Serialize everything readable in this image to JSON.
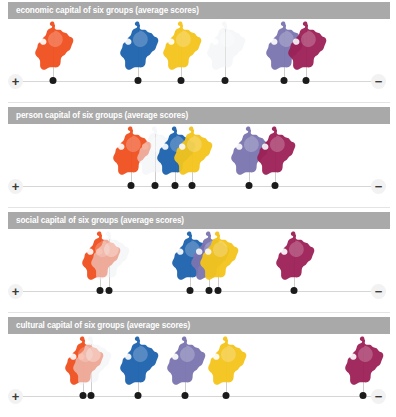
{
  "figure": {
    "background": "#ffffff",
    "title_bar_color": "#a9a9a9",
    "title_text_color": "#ffffff",
    "axis_color": "#d8d6d4",
    "dot_color": "#1b1b1b",
    "axis_left_label": "+",
    "axis_right_label": "−"
  },
  "group_colors": {
    "orange": "#f04f1e",
    "white": "#eef1f5",
    "blue": "#1d63ae",
    "yellow": "#f4c51c",
    "purple": "#7b74b0",
    "magenta": "#9c1f56"
  },
  "chart_data": {
    "type": "scatter",
    "title": "Capital of six groups (average scores)",
    "xlabel": "",
    "ylabel": "",
    "xlim": [
      0,
      100
    ],
    "grid": false,
    "legend": "none",
    "axis_note": "Horizontal axis runs from + (high, left) to − (low, right)",
    "categories": [
      "orange",
      "white",
      "blue",
      "yellow",
      "purple",
      "magenta"
    ],
    "panels": [
      {
        "title": "economic capital of six groups (average scores)",
        "points": [
          {
            "group": "orange",
            "x": 8.5,
            "color": "#f04f1e"
          },
          {
            "group": "blue",
            "x": 33.0,
            "color": "#1d63ae"
          },
          {
            "group": "yellow",
            "x": 45.5,
            "color": "#f4c51c"
          },
          {
            "group": "white",
            "x": 58.0,
            "color": "#eef1f5"
          },
          {
            "group": "purple",
            "x": 75.0,
            "color": "#7b74b0"
          },
          {
            "group": "magenta",
            "x": 81.5,
            "color": "#9c1f56"
          }
        ]
      },
      {
        "title": "person capital of six groups (average scores)",
        "points": [
          {
            "group": "orange",
            "x": 31.0,
            "color": "#f04f1e"
          },
          {
            "group": "white",
            "x": 38.0,
            "color": "#eef1f5"
          },
          {
            "group": "blue",
            "x": 43.5,
            "color": "#1d63ae"
          },
          {
            "group": "yellow",
            "x": 48.5,
            "color": "#f4c51c"
          },
          {
            "group": "purple",
            "x": 65.0,
            "color": "#7b74b0"
          },
          {
            "group": "magenta",
            "x": 72.5,
            "color": "#9c1f56"
          }
        ]
      },
      {
        "title": "social capital of six groups (average scores)",
        "points": [
          {
            "group": "orange",
            "x": 22.0,
            "color": "#f04f1e"
          },
          {
            "group": "white",
            "x": 24.5,
            "color": "#eef1f5"
          },
          {
            "group": "blue",
            "x": 48.0,
            "color": "#1d63ae"
          },
          {
            "group": "purple",
            "x": 53.5,
            "color": "#7b74b0"
          },
          {
            "group": "yellow",
            "x": 56.0,
            "color": "#f4c51c"
          },
          {
            "group": "magenta",
            "x": 78.0,
            "color": "#9c1f56"
          }
        ]
      },
      {
        "title": "cultural capital of six groups (average scores)",
        "points": [
          {
            "group": "orange",
            "x": 17.0,
            "color": "#f04f1e"
          },
          {
            "group": "white",
            "x": 19.5,
            "color": "#eef1f5"
          },
          {
            "group": "blue",
            "x": 33.0,
            "color": "#1d63ae"
          },
          {
            "group": "purple",
            "x": 46.5,
            "color": "#7b74b0"
          },
          {
            "group": "yellow",
            "x": 58.5,
            "color": "#f4c51c"
          },
          {
            "group": "magenta",
            "x": 98.0,
            "color": "#9c1f56"
          }
        ]
      }
    ]
  }
}
